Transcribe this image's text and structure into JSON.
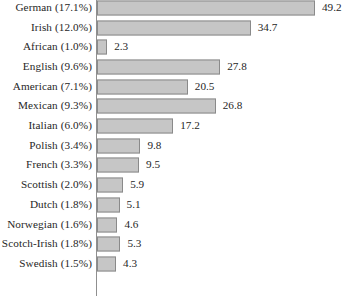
{
  "chart_data": {
    "type": "bar",
    "orientation": "horizontal",
    "title": "",
    "subtitle": "",
    "xlabel": "",
    "ylabel": "",
    "grid": false,
    "legend": null,
    "axis_line": "vertical-left",
    "xlim": [
      0,
      49.2
    ],
    "categories": [
      "German (17.1%)",
      "Irish (12.0%)",
      "African (1.0%)",
      "English (9.6%)",
      "American (7.1%)",
      "Mexican (9.3%)",
      "Italian (6.0%)",
      "Polish (3.4%)",
      "French (3.3%)",
      "Scottish (2.0%)",
      "Dutch (1.8%)",
      "Norwegian (1.6%)",
      "Scotch-Irish (1.8%)",
      "Swedish (1.5%)"
    ],
    "values": [
      49.2,
      34.7,
      2.3,
      27.8,
      20.5,
      26.8,
      17.2,
      9.8,
      9.5,
      5.9,
      5.1,
      4.6,
      5.3,
      4.3
    ],
    "value_labels": [
      "49.2",
      "34.7",
      "2.3",
      "27.8",
      "20.5",
      "26.8",
      "17.2",
      "9.8",
      "9.5",
      "5.9",
      "5.1",
      "4.6",
      "5.3",
      "4.3"
    ],
    "bar_fill_color": "#c6c6c6",
    "bar_border_color": "#8a8a8a",
    "text_color": "#262626",
    "background_color": "#ffffff"
  }
}
